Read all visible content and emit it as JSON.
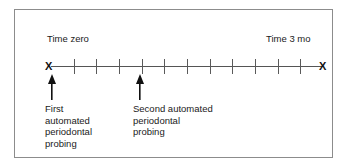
{
  "figure": {
    "type": "timeline-diagram",
    "frame": {
      "border_color": "#8c8c8c",
      "background": "#ffffff"
    },
    "axis": {
      "line_color": "#555555",
      "start_marker": "X",
      "end_marker": "X",
      "tick_count": 11,
      "tick_color": "#5a5a5a"
    },
    "labels": {
      "start": "Time zero",
      "end": "Time 3 mo"
    },
    "events": [
      {
        "marker": "up-arrow",
        "caption": "First\nautomated\nperiodontal\nprobing"
      },
      {
        "marker": "up-arrow",
        "caption": "Second automated\nperiodontal\nprobing"
      }
    ]
  }
}
